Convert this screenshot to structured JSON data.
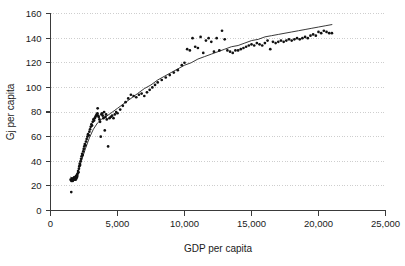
{
  "chart_data": {
    "type": "scatter",
    "title": "",
    "xlabel": "GDP per capita",
    "ylabel": "Gj per capita",
    "xlim": [
      0,
      25000
    ],
    "ylim": [
      0,
      160
    ],
    "xticks": [
      0,
      5000,
      10000,
      15000,
      20000,
      25000
    ],
    "xtick_labels": [
      "0",
      "5,000",
      "10,000",
      "15,000",
      "20,000",
      "25,000"
    ],
    "yticks": [
      0,
      20,
      40,
      60,
      80,
      100,
      120,
      140,
      160
    ],
    "ytick_labels": [
      "0",
      "20",
      "40",
      "60",
      "80",
      "100",
      "120",
      "140",
      "160"
    ],
    "grid": "horizontal-dotted",
    "legend": null,
    "marker_color": "#111111",
    "line_color": "#222222",
    "grid_color": "#b9b9b9",
    "axis_color": "#3a3a3a",
    "series": [
      {
        "name": "observations",
        "type": "scatter",
        "points": [
          [
            1550,
            15
          ],
          [
            1500,
            25
          ],
          [
            1560,
            24
          ],
          [
            1600,
            26
          ],
          [
            1620,
            25
          ],
          [
            1660,
            24
          ],
          [
            1700,
            26
          ],
          [
            1720,
            25
          ],
          [
            1760,
            27
          ],
          [
            1800,
            25
          ],
          [
            1820,
            26
          ],
          [
            1850,
            27
          ],
          [
            1880,
            25
          ],
          [
            1900,
            28
          ],
          [
            1930,
            26
          ],
          [
            1960,
            27
          ],
          [
            1980,
            29
          ],
          [
            2000,
            28
          ],
          [
            2030,
            30
          ],
          [
            2060,
            32
          ],
          [
            2090,
            31
          ],
          [
            2120,
            34
          ],
          [
            2150,
            36
          ],
          [
            2180,
            38
          ],
          [
            2210,
            37
          ],
          [
            2240,
            40
          ],
          [
            2280,
            42
          ],
          [
            2320,
            44
          ],
          [
            2360,
            46
          ],
          [
            2400,
            45
          ],
          [
            2440,
            48
          ],
          [
            2480,
            50
          ],
          [
            2520,
            52
          ],
          [
            2560,
            54
          ],
          [
            2600,
            53
          ],
          [
            2650,
            56
          ],
          [
            2700,
            58
          ],
          [
            2750,
            60
          ],
          [
            2800,
            62
          ],
          [
            2850,
            61
          ],
          [
            2900,
            64
          ],
          [
            2950,
            66
          ],
          [
            3000,
            68
          ],
          [
            3050,
            70
          ],
          [
            3100,
            69
          ],
          [
            3150,
            72
          ],
          [
            3200,
            74
          ],
          [
            3250,
            73
          ],
          [
            3300,
            75
          ],
          [
            3350,
            76
          ],
          [
            3400,
            77
          ],
          [
            3450,
            78
          ],
          [
            3500,
            79
          ],
          [
            3520,
            83
          ],
          [
            3560,
            77
          ],
          [
            3600,
            76
          ],
          [
            3650,
            74
          ],
          [
            3700,
            72
          ],
          [
            3750,
            60
          ],
          [
            3800,
            78
          ],
          [
            3850,
            79
          ],
          [
            3900,
            77
          ],
          [
            3950,
            75
          ],
          [
            4000,
            80
          ],
          [
            4050,
            65
          ],
          [
            4100,
            76
          ],
          [
            4150,
            78
          ],
          [
            4200,
            74
          ],
          [
            4300,
            52
          ],
          [
            4400,
            75
          ],
          [
            4500,
            76
          ],
          [
            4600,
            77
          ],
          [
            4700,
            75
          ],
          [
            4800,
            78
          ],
          [
            4900,
            80
          ],
          [
            5000,
            79
          ],
          [
            5200,
            82
          ],
          [
            5400,
            85
          ],
          [
            5600,
            88
          ],
          [
            5800,
            91
          ],
          [
            6000,
            94
          ],
          [
            6200,
            93
          ],
          [
            6400,
            92
          ],
          [
            6600,
            94
          ],
          [
            6800,
            95
          ],
          [
            7000,
            93
          ],
          [
            7200,
            96
          ],
          [
            7400,
            98
          ],
          [
            7600,
            100
          ],
          [
            7800,
            102
          ],
          [
            8000,
            104
          ],
          [
            8300,
            106
          ],
          [
            8600,
            108
          ],
          [
            8900,
            110
          ],
          [
            9200,
            112
          ],
          [
            9500,
            114
          ],
          [
            9800,
            118
          ],
          [
            10000,
            120
          ],
          [
            10200,
            131
          ],
          [
            10400,
            130
          ],
          [
            10600,
            140
          ],
          [
            10800,
            133
          ],
          [
            11000,
            132
          ],
          [
            11200,
            141
          ],
          [
            11400,
            128
          ],
          [
            11600,
            138
          ],
          [
            11800,
            140
          ],
          [
            12000,
            137
          ],
          [
            12200,
            129
          ],
          [
            12400,
            140
          ],
          [
            12600,
            130
          ],
          [
            12800,
            146
          ],
          [
            13000,
            139
          ],
          [
            13200,
            130
          ],
          [
            13400,
            129
          ],
          [
            13600,
            128
          ],
          [
            13800,
            130
          ],
          [
            14000,
            130
          ],
          [
            14200,
            131
          ],
          [
            14400,
            132
          ],
          [
            14600,
            133
          ],
          [
            14800,
            134
          ],
          [
            15000,
            135
          ],
          [
            15200,
            134
          ],
          [
            15400,
            136
          ],
          [
            15600,
            135
          ],
          [
            15800,
            134
          ],
          [
            16000,
            136
          ],
          [
            16200,
            138
          ],
          [
            16400,
            131
          ],
          [
            16600,
            137
          ],
          [
            16800,
            136
          ],
          [
            17000,
            137
          ],
          [
            17200,
            138
          ],
          [
            17400,
            137
          ],
          [
            17600,
            138
          ],
          [
            17800,
            139
          ],
          [
            18000,
            138
          ],
          [
            18200,
            139
          ],
          [
            18400,
            140
          ],
          [
            18600,
            139
          ],
          [
            18800,
            140
          ],
          [
            19000,
            141
          ],
          [
            19200,
            140
          ],
          [
            19400,
            142
          ],
          [
            19600,
            143
          ],
          [
            19800,
            142
          ],
          [
            20000,
            145
          ],
          [
            20200,
            144
          ],
          [
            20400,
            146
          ],
          [
            20600,
            145
          ],
          [
            20800,
            144
          ],
          [
            21000,
            144
          ]
        ]
      },
      {
        "name": "fitted-curve",
        "type": "line",
        "points": [
          [
            1500,
            27
          ],
          [
            1700,
            26
          ],
          [
            1900,
            28
          ],
          [
            2100,
            33
          ],
          [
            2300,
            40
          ],
          [
            2600,
            50
          ],
          [
            2900,
            59
          ],
          [
            3200,
            66
          ],
          [
            3500,
            71
          ],
          [
            3800,
            74
          ],
          [
            4100,
            76
          ],
          [
            4500,
            79
          ],
          [
            5000,
            83
          ],
          [
            5500,
            87
          ],
          [
            6000,
            91
          ],
          [
            6500,
            95
          ],
          [
            7000,
            99
          ],
          [
            7500,
            102
          ],
          [
            8000,
            106
          ],
          [
            8500,
            109
          ],
          [
            9000,
            112
          ],
          [
            9500,
            115
          ],
          [
            10000,
            118
          ],
          [
            10500,
            120
          ],
          [
            11000,
            123
          ],
          [
            11500,
            125
          ],
          [
            12000,
            127
          ],
          [
            12500,
            129
          ],
          [
            13000,
            131
          ],
          [
            13500,
            133
          ],
          [
            14000,
            134
          ],
          [
            14500,
            136
          ],
          [
            15000,
            138
          ],
          [
            15500,
            139
          ],
          [
            16000,
            141
          ],
          [
            16500,
            142
          ],
          [
            17000,
            143
          ],
          [
            17500,
            144
          ],
          [
            18000,
            145
          ],
          [
            18500,
            146
          ],
          [
            19000,
            147
          ],
          [
            19500,
            148
          ],
          [
            20000,
            149
          ],
          [
            20500,
            150
          ],
          [
            21000,
            151
          ]
        ]
      }
    ]
  }
}
